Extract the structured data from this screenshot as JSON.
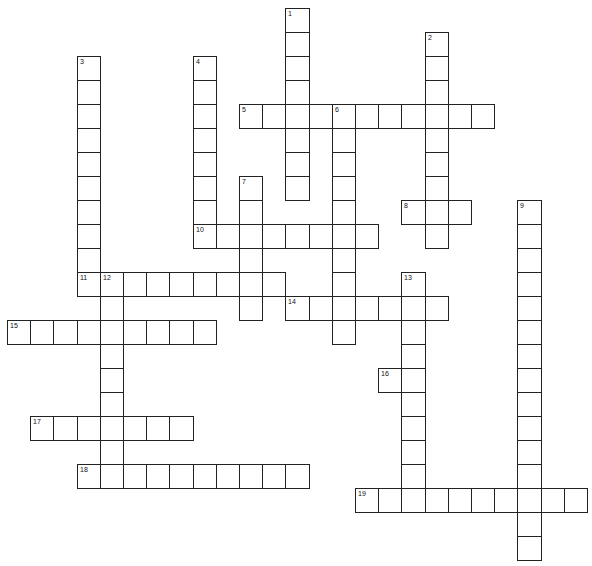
{
  "puzzle": {
    "type": "crossword",
    "grid": {
      "origin_x": 7,
      "origin_y": 8,
      "cell_w": 23.2,
      "cell_h": 24.0,
      "border_color": "#222222",
      "background": "#ffffff"
    },
    "entries": [
      {
        "number": "1",
        "direction": "down",
        "row": 0,
        "col": 12,
        "length": 8
      },
      {
        "number": "2",
        "direction": "down",
        "row": 1,
        "col": 18,
        "length": 9
      },
      {
        "number": "3",
        "direction": "down",
        "row": 2,
        "col": 3,
        "length": 10
      },
      {
        "number": "4",
        "direction": "down",
        "row": 2,
        "col": 8,
        "length": 8
      },
      {
        "number": "5",
        "direction": "across",
        "row": 4,
        "col": 10,
        "length": 11
      },
      {
        "number": "6",
        "direction": "down",
        "row": 4,
        "col": 14,
        "length": 10
      },
      {
        "number": "7",
        "direction": "down",
        "row": 7,
        "col": 10,
        "length": 6
      },
      {
        "number": "8",
        "direction": "across",
        "row": 8,
        "col": 17,
        "length": 3
      },
      {
        "number": "9",
        "direction": "down",
        "row": 8,
        "col": 22,
        "length": 15
      },
      {
        "number": "10",
        "direction": "across",
        "row": 9,
        "col": 8,
        "length": 8
      },
      {
        "number": "11",
        "direction": "across",
        "row": 11,
        "col": 3,
        "length": 9
      },
      {
        "number": "12",
        "direction": "down",
        "row": 11,
        "col": 4,
        "length": 9
      },
      {
        "number": "13",
        "direction": "down",
        "row": 11,
        "col": 17,
        "length": 10
      },
      {
        "number": "14",
        "direction": "across",
        "row": 12,
        "col": 12,
        "length": 7
      },
      {
        "number": "15",
        "direction": "across",
        "row": 13,
        "col": 0,
        "length": 9
      },
      {
        "number": "16",
        "direction": "across",
        "row": 15,
        "col": 16,
        "length": 2
      },
      {
        "number": "17",
        "direction": "across",
        "row": 17,
        "col": 1,
        "length": 7
      },
      {
        "number": "18",
        "direction": "across",
        "row": 19,
        "col": 3,
        "length": 10
      },
      {
        "number": "19",
        "direction": "across",
        "row": 20,
        "col": 15,
        "length": 10
      }
    ]
  }
}
